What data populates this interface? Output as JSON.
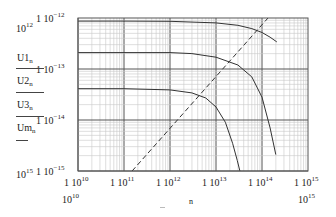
{
  "chart_data": {
    "type": "line",
    "title": "",
    "xlabel": "n",
    "ylabel": "",
    "xscale": "log",
    "yscale": "log",
    "xlim": [
      10000000000.0,
      1000000000000000.0
    ],
    "ylim": [
      1e-15,
      1e-12
    ],
    "grid": true,
    "x_ticks": [
      "1 10^10",
      "1 10^11",
      "1 10^12",
      "1 10^13",
      "1 10^14",
      "1 10^15"
    ],
    "y_ticks": [
      "1 10^-12",
      "1 10^-13",
      "1 10^-14",
      "1 10^-15"
    ],
    "x_range_labels": {
      "min": "10^10",
      "max": "10^15"
    },
    "y_range_labels": {
      "max": "10^12",
      "min": "10^15"
    },
    "legend": [
      "U1_n",
      "U2_n",
      "U3_n",
      "Um_n"
    ],
    "series": [
      {
        "name": "U1_n",
        "style": "solid",
        "x": [
          10000000000.0,
          100000000000.0,
          1000000000000.0,
          10000000000000.0,
          30000000000000.0,
          60000000000000.0,
          100000000000000.0,
          150000000000000.0,
          210000000000000.0
        ],
        "y": [
          8.7e-13,
          8.7e-13,
          8.6e-13,
          8e-13,
          7.2e-13,
          6.2e-13,
          5.2e-13,
          4.2e-13,
          3.4e-13
        ]
      },
      {
        "name": "U2_n",
        "style": "solid",
        "x": [
          10000000000.0,
          100000000000.0,
          1000000000000.0,
          3000000000000.0,
          10000000000000.0,
          30000000000000.0,
          60000000000000.0,
          100000000000000.0,
          150000000000000.0,
          200000000000000.0
        ],
        "y": [
          2.1e-13,
          2.1e-13,
          2.1e-13,
          2e-13,
          1.7e-13,
          1.2e-13,
          7e-14,
          2.8e-14,
          7e-15,
          2.1e-15
        ]
      },
      {
        "name": "U3_n",
        "style": "solid",
        "x": [
          10000000000.0,
          100000000000.0,
          1000000000000.0,
          3000000000000.0,
          6000000000000.0,
          10000000000000.0,
          16000000000000.0,
          23000000000000.0,
          29000000000000.0,
          33000000000000.0
        ],
        "y": [
          4.1e-14,
          4.1e-14,
          3.9e-14,
          3.4e-14,
          2.7e-14,
          1.8e-14,
          9e-15,
          3.5e-15,
          1.6e-15,
          1e-15
        ]
      },
      {
        "name": "Um_n",
        "style": "dashed",
        "x": [
          150000000000.0,
          135000000000000.0
        ],
        "y": [
          1e-15,
          1e-12
        ]
      }
    ]
  },
  "axes": {
    "y_top_exp_label": "10",
    "y_top_exp_sup": "12",
    "y_bottom_exp_label": "10",
    "y_bottom_exp_sup": "15",
    "x_left_exp_label": "10",
    "x_left_exp_sup": "10",
    "x_right_exp_label": "10",
    "x_right_exp_sup": "15",
    "x_title": "n",
    "y_ticks": [
      {
        "prefix": "1 10",
        "exp": "−12"
      },
      {
        "prefix": "1 10",
        "exp": "−13"
      },
      {
        "prefix": "1 10",
        "exp": "−14"
      },
      {
        "prefix": "1 10",
        "exp": "−15"
      }
    ],
    "x_ticks": [
      {
        "prefix": "1 10",
        "exp": "10"
      },
      {
        "prefix": "1 10",
        "exp": "11"
      },
      {
        "prefix": "1 10",
        "exp": "12"
      },
      {
        "prefix": "1 10",
        "exp": "13"
      },
      {
        "prefix": "1 10",
        "exp": "14"
      },
      {
        "prefix": "1 10",
        "exp": "15"
      }
    ]
  },
  "legend": [
    {
      "name": "U1",
      "sub": "n"
    },
    {
      "name": "U2",
      "sub": "n"
    },
    {
      "name": "U3",
      "sub": "n"
    },
    {
      "name": "Um",
      "sub": "n"
    }
  ],
  "colors": {
    "grid_minor": "#c8c8c8",
    "grid_major": "#555555",
    "curve": "#333333",
    "frame": "#555555"
  }
}
